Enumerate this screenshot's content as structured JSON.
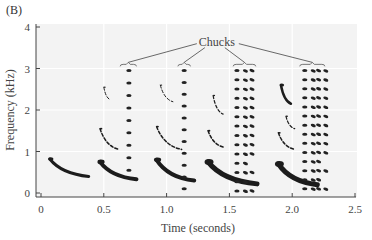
{
  "panel_label": "(B)",
  "chart_data": {
    "type": "heatmap",
    "subtype": "spectrogram",
    "title": "",
    "xlabel": "Time (seconds)",
    "ylabel": "Frequency (kHz)",
    "xlim": [
      0,
      2.5
    ],
    "ylim": [
      0,
      4
    ],
    "xticks": [
      0,
      0.5,
      1.0,
      1.5,
      2.0,
      2.5
    ],
    "xtick_labels": [
      "0",
      "0.5",
      "1.0",
      "1.5",
      "2.0",
      "2.5"
    ],
    "yticks": [
      0,
      1,
      2,
      3,
      4
    ],
    "ytick_labels": [
      "0",
      "1",
      "2",
      "3",
      "4"
    ],
    "grid": true,
    "background": "#f3f3f3",
    "annotation": {
      "text": "Chucks",
      "x": 1.4,
      "y": 3.55,
      "targets": [
        {
          "t_start": 0.63,
          "t_end": 0.76,
          "freq": 3.1
        },
        {
          "t_start": 1.09,
          "t_end": 1.19,
          "freq": 3.1
        },
        {
          "t_start": 1.53,
          "t_end": 1.71,
          "freq": 3.1
        },
        {
          "t_start": 2.06,
          "t_end": 2.26,
          "freq": 3.1
        }
      ]
    },
    "notes": [
      {
        "name": "whine-1",
        "t_start": 0.07,
        "f_start": 0.82,
        "t_end": 0.38,
        "f_end": 0.4,
        "weight": 3
      },
      {
        "name": "whine-2",
        "t_start": 0.47,
        "f_start": 0.75,
        "t_end": 0.76,
        "f_end": 0.33,
        "weight": 4
      },
      {
        "name": "whine-3",
        "t_start": 0.92,
        "f_start": 0.8,
        "t_end": 1.22,
        "f_end": 0.3,
        "weight": 4
      },
      {
        "name": "whine-4",
        "t_start": 1.33,
        "f_start": 0.75,
        "t_end": 1.72,
        "f_end": 0.22,
        "weight": 5
      },
      {
        "name": "whine-5",
        "t_start": 1.89,
        "f_start": 0.7,
        "t_end": 2.2,
        "f_end": 0.2,
        "weight": 5
      },
      {
        "name": "harm-2a",
        "t_start": 0.47,
        "f_start": 1.55,
        "t_end": 0.62,
        "f_end": 1.05,
        "weight": 1.5
      },
      {
        "name": "harm-2b",
        "t_start": 0.92,
        "f_start": 1.6,
        "t_end": 1.12,
        "f_end": 1.05,
        "weight": 1.5
      },
      {
        "name": "harm-2c",
        "t_start": 1.33,
        "f_start": 1.5,
        "t_end": 1.46,
        "f_end": 1.1,
        "weight": 1.5
      },
      {
        "name": "harm-2d",
        "t_start": 1.89,
        "f_start": 1.45,
        "t_end": 2.02,
        "f_end": 1.05,
        "weight": 1.5
      },
      {
        "name": "harm-3a",
        "t_start": 0.5,
        "f_start": 2.55,
        "t_end": 0.55,
        "f_end": 2.25,
        "weight": 1
      },
      {
        "name": "harm-3b",
        "t_start": 0.95,
        "f_start": 2.6,
        "t_end": 1.05,
        "f_end": 2.2,
        "weight": 1
      },
      {
        "name": "harm-3c",
        "t_start": 1.37,
        "f_start": 2.35,
        "t_end": 1.45,
        "f_end": 1.9,
        "weight": 1.2
      },
      {
        "name": "harm-3d",
        "t_start": 1.91,
        "f_start": 2.6,
        "t_end": 1.99,
        "f_end": 2.15,
        "weight": 2.5
      },
      {
        "name": "harm-3e",
        "t_start": 1.95,
        "f_start": 1.85,
        "t_end": 2.02,
        "f_end": 1.55,
        "weight": 1.2
      }
    ],
    "chucks": [
      {
        "name": "chuck-1",
        "columns": [
          0.7
        ],
        "freq_start": 0.55,
        "freq_end": 2.95,
        "rows": 9
      },
      {
        "name": "chuck-2",
        "columns": [
          1.14
        ],
        "freq_start": 0.1,
        "freq_end": 2.95,
        "rows": 11
      },
      {
        "name": "chuck-3",
        "columns": [
          1.56,
          1.62,
          1.68
        ],
        "freq_start": 0.05,
        "freq_end": 2.95,
        "rows": 14
      },
      {
        "name": "chuck-4",
        "columns": [
          2.1,
          2.16,
          2.21,
          2.26
        ],
        "freq_start": 0.1,
        "freq_end": 2.95,
        "rows": 14
      }
    ]
  }
}
